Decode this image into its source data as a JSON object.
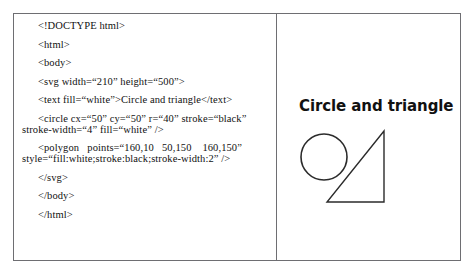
{
  "figure": {
    "border_color": "#6e6e72",
    "background": "#ffffff"
  },
  "code_panel": {
    "name": "svg-source-code",
    "language": "html",
    "lines": [
      {
        "id": "doctype",
        "indent": true,
        "text": "<!DOCTYPE html>"
      },
      {
        "id": "html-open",
        "indent": true,
        "text": "<html>"
      },
      {
        "id": "body-open",
        "indent": true,
        "text": "<body>"
      },
      {
        "id": "svg-open",
        "indent": true,
        "text": "<svg width=“210” height=“500”>"
      },
      {
        "id": "text-el",
        "indent": true,
        "text": "<text fill=“white”>Circle and triangle</text>"
      },
      {
        "id": "circle-1",
        "indent": true,
        "text": "<circle cx=“50” cy=“50” r=“40” stroke=“black”"
      },
      {
        "id": "circle-2",
        "indent": false,
        "text": "stroke-width=“4” fill=“white” />"
      },
      {
        "id": "polygon-1",
        "indent": true,
        "text": "<polygon   points=“160,10   50,150    160,150”"
      },
      {
        "id": "polygon-2",
        "indent": false,
        "text": "style=“fill:white;stroke:black;stroke-width:2” />"
      },
      {
        "id": "svg-close",
        "indent": true,
        "text": "</svg>"
      },
      {
        "id": "body-close",
        "indent": true,
        "text": "</body>"
      },
      {
        "id": "html-close",
        "indent": true,
        "text": "</html>"
      }
    ]
  },
  "render_panel": {
    "title": "Circle and triangle",
    "shapes": {
      "circle": {
        "name": "circle-shape",
        "cx": 50,
        "cy": 50,
        "r": 40,
        "stroke": "black",
        "stroke_width": 4,
        "fill": "white"
      },
      "polygon": {
        "name": "triangle-shape",
        "points": "160,10 50,150 160,150",
        "fill": "white",
        "stroke": "black",
        "stroke_width": 2
      }
    }
  }
}
